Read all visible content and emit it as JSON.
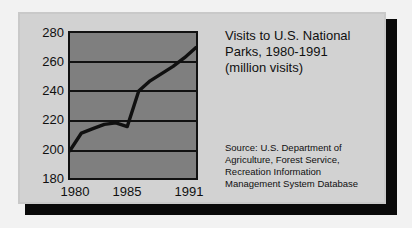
{
  "card": {
    "background_color": "#d2d2d2",
    "shadow_color": "#0a0a0a",
    "plot_area_color": "#7f7f7f",
    "line_color": "#101010"
  },
  "title": {
    "line1": "Visits to U.S. National",
    "line2": "Parks, 1980-1991",
    "line3": "(million visits)"
  },
  "source": {
    "line1": "Source: U.S. Department of",
    "line2": "Agriculture, Forest Service,",
    "line3": "Recreation Information",
    "line4": "Management System Database"
  },
  "axis": {
    "y_ticks": [
      "280",
      "260",
      "240",
      "220",
      "200",
      "180"
    ],
    "x_ticks": [
      "1980",
      "1985",
      "1991"
    ]
  },
  "chart_data": {
    "type": "line",
    "title": "Visits to U.S. National Parks, 1980-1991 (million visits)",
    "subtitle": "",
    "xlabel": "",
    "ylabel": "million visits",
    "x": [
      1980,
      1981,
      1982,
      1983,
      1984,
      1985,
      1986,
      1987,
      1988,
      1989,
      1990,
      1991
    ],
    "values": [
      199,
      211,
      214,
      217,
      218,
      215.5,
      240,
      247,
      252,
      257,
      263,
      270
    ],
    "series": [
      {
        "name": "Visits to U.S. National Parks",
        "values": [
          199,
          211,
          214,
          217,
          218,
          215.5,
          240,
          247,
          252,
          257,
          263,
          270
        ]
      }
    ],
    "xlim": [
      1980,
      1991
    ],
    "ylim": [
      180,
      280
    ],
    "ytick_values": [
      280,
      260,
      240,
      220,
      200,
      180
    ],
    "xtick_values": [
      1980,
      1985,
      1991
    ],
    "grid": true,
    "grid_axis": "y",
    "legend": false,
    "legend_position": "none",
    "annotations": [
      "Source: U.S. Department of Agriculture, Forest Service, Recreation Information Management System Database"
    ]
  }
}
